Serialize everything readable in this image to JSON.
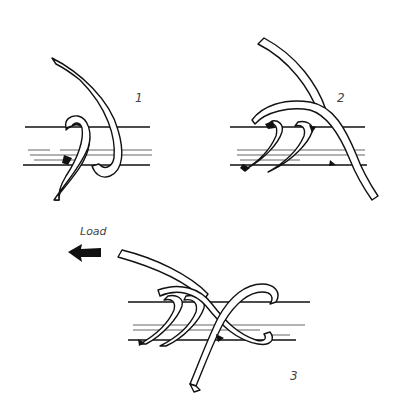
{
  "figure": {
    "type": "knot-tying-instructions",
    "steps": [
      {
        "number": "1",
        "label": "1"
      },
      {
        "number": "2",
        "label": "2"
      },
      {
        "number": "3",
        "label": "3"
      }
    ],
    "annotations": {
      "load_label": "Load",
      "load_arrow_direction": "left"
    },
    "colors": {
      "ink": "#111111",
      "background": "#ffffff",
      "label_text": "#444444"
    }
  }
}
